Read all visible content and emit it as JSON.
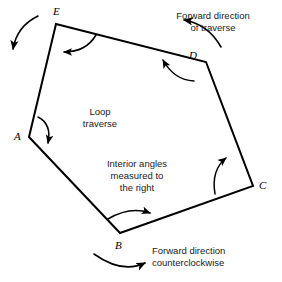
{
  "figure": {
    "background_color": "#ffffff",
    "line_color": "#000000",
    "text_color": "#1a1a1a",
    "width": 282,
    "height": 282
  },
  "vertices": [
    {
      "id": "A",
      "label": "A",
      "x": 29,
      "y": 137,
      "label_x": 14,
      "label_y": 131
    },
    {
      "id": "B",
      "label": "B",
      "x": 120,
      "y": 233,
      "label_x": 115,
      "label_y": 240
    },
    {
      "id": "C",
      "label": "C",
      "x": 253,
      "y": 186,
      "label_x": 259,
      "label_y": 180
    },
    {
      "id": "D",
      "label": "D",
      "x": 206,
      "y": 62,
      "label_x": 189,
      "label_y": 50
    },
    {
      "id": "E",
      "label": "E",
      "x": 56,
      "y": 24,
      "label_x": 53,
      "label_y": 6
    }
  ],
  "traverse": {
    "closed": true,
    "order": [
      "A",
      "B",
      "C",
      "D",
      "E"
    ]
  },
  "angle_arcs": [
    {
      "at": "A",
      "direction": "clockwise-down",
      "arrowhead": "down"
    },
    {
      "at": "B",
      "direction": "clockwise-right",
      "arrowhead": "right"
    },
    {
      "at": "C",
      "direction": "clockwise-up",
      "arrowhead": "up-right"
    },
    {
      "at": "D",
      "direction": "clockwise-left",
      "arrowhead": "up-left"
    },
    {
      "at": "E",
      "direction": "clockwise-left",
      "arrowhead": "down-left"
    }
  ],
  "direction_arrows": [
    {
      "id": "outer-left-arrow",
      "points_to": "down-left",
      "near": "E"
    },
    {
      "id": "forward-traverse-arrow",
      "points_to": "left",
      "near": "D"
    },
    {
      "id": "counterclockwise-arrow",
      "points_to": "up-right",
      "near": "B"
    }
  ],
  "annotations": {
    "loop_traverse": {
      "lines": [
        "Loop",
        "traverse"
      ],
      "x": 100,
      "y": 106,
      "align": "center"
    },
    "interior_angles": {
      "lines": [
        "Interior angles",
        "measured to",
        "the right"
      ],
      "x": 95,
      "y": 158,
      "align": "center"
    },
    "forward_direction_traverse": {
      "lines": [
        "Forward direction",
        "of traverse"
      ],
      "x": 188,
      "y": 10,
      "align": "center"
    },
    "forward_direction_counterclockwise": {
      "lines": [
        "Forward direction",
        "counterclockwise"
      ],
      "x": 152,
      "y": 245,
      "align": "left"
    }
  }
}
